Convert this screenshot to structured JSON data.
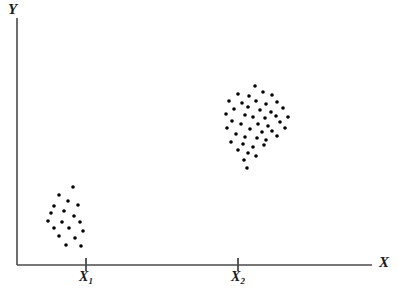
{
  "chart_data": {
    "type": "scatter",
    "title": "",
    "xlabel": "X",
    "ylabel": "Y",
    "xlim": [
      0,
      1
    ],
    "ylim": [
      0,
      1
    ],
    "grid": false,
    "legend": null,
    "axis_style": "open-corner-arrowless",
    "marker": {
      "shape": "circle",
      "color": "#000000",
      "size_px": 3.6
    },
    "axis_ticks": {
      "x": [
        {
          "label": "X1",
          "label_base": "X",
          "label_sub": "1",
          "px": 86
        },
        {
          "label": "X2",
          "label_base": "X",
          "label_sub": "2",
          "px": 238
        }
      ],
      "y": []
    },
    "series": [
      {
        "name": "cluster-1",
        "label": "Lower-left cluster at X1",
        "n": 18,
        "points_px": [
          [
            73,
            187
          ],
          [
            59,
            195
          ],
          [
            68,
            201
          ],
          [
            54,
            206
          ],
          [
            78,
            205
          ],
          [
            51,
            213
          ],
          [
            64,
            211
          ],
          [
            74,
            216
          ],
          [
            48,
            221
          ],
          [
            62,
            222
          ],
          [
            80,
            222
          ],
          [
            54,
            228
          ],
          [
            69,
            228
          ],
          [
            83,
            231
          ],
          [
            59,
            236
          ],
          [
            75,
            238
          ],
          [
            66,
            245
          ],
          [
            81,
            246
          ]
        ]
      },
      {
        "name": "cluster-2",
        "label": "Upper-right cluster at X2",
        "n": 45,
        "points_px": [
          [
            255,
            86
          ],
          [
            238,
            94
          ],
          [
            249,
            96
          ],
          [
            263,
            92
          ],
          [
            272,
            95
          ],
          [
            229,
            101
          ],
          [
            242,
            103
          ],
          [
            256,
            101
          ],
          [
            248,
            107
          ],
          [
            266,
            104
          ],
          [
            277,
            102
          ],
          [
            234,
            109
          ],
          [
            260,
            110
          ],
          [
            271,
            112
          ],
          [
            283,
            108
          ],
          [
            226,
            114
          ],
          [
            245,
            115
          ],
          [
            253,
            117
          ],
          [
            265,
            118
          ],
          [
            276,
            116
          ],
          [
            288,
            117
          ],
          [
            232,
            121
          ],
          [
            241,
            124
          ],
          [
            258,
            124
          ],
          [
            268,
            126
          ],
          [
            280,
            122
          ],
          [
            227,
            128
          ],
          [
            250,
            129
          ],
          [
            262,
            132
          ],
          [
            272,
            131
          ],
          [
            285,
            128
          ],
          [
            236,
            134
          ],
          [
            245,
            137
          ],
          [
            257,
            138
          ],
          [
            266,
            140
          ],
          [
            277,
            136
          ],
          [
            231,
            142
          ],
          [
            243,
            144
          ],
          [
            253,
            147
          ],
          [
            264,
            145
          ],
          [
            238,
            150
          ],
          [
            248,
            153
          ],
          [
            256,
            156
          ],
          [
            244,
            160
          ],
          [
            247,
            168
          ]
        ]
      }
    ]
  },
  "labels": {
    "y_axis": "Y",
    "x_axis": "X"
  },
  "colors": {
    "marker": "#000000",
    "axis": "#4a4a4a",
    "background": "#ffffff",
    "text": "#1a1a1a"
  },
  "axes_geometry": {
    "origin_x": 17,
    "origin_y": 265,
    "y_top": 18,
    "x_right": 372,
    "tick_top": 258,
    "tick_bottom": 271
  }
}
